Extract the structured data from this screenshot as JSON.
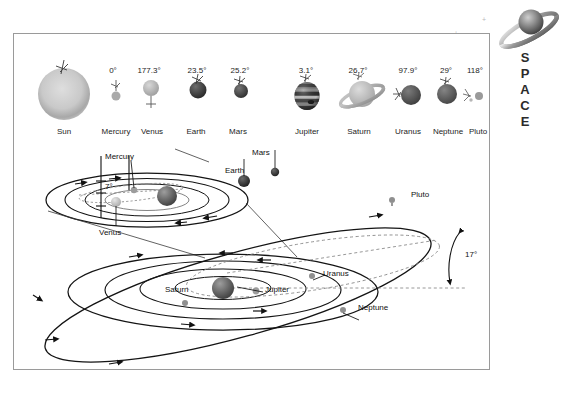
{
  "logo": {
    "wordmark": "SPACE",
    "planet_icon": "saturn-icon"
  },
  "top_row": {
    "caption_note": "Axial tilt of each body in degrees",
    "bodies": [
      {
        "name": "Sun",
        "tilt": "",
        "icon": "sun-icon",
        "color": "#b8b8b8"
      },
      {
        "name": "Mercury",
        "tilt": "0°",
        "icon": "mercury-icon",
        "color": "#a9a9a9"
      },
      {
        "name": "Venus",
        "tilt": "177.3°",
        "icon": "venus-icon",
        "color": "#b0b0b0"
      },
      {
        "name": "Earth",
        "tilt": "23.5°",
        "icon": "earth-icon",
        "color": "#3f3f3f"
      },
      {
        "name": "Mars",
        "tilt": "25.2°",
        "icon": "mars-icon",
        "color": "#4a4a4a"
      },
      {
        "name": "Jupiter",
        "tilt": "3.1°",
        "icon": "jupiter-icon",
        "color": "#6b6b6b"
      },
      {
        "name": "Saturn",
        "tilt": "26.7°",
        "icon": "saturn-icon",
        "color": "#b4b4b4"
      },
      {
        "name": "Uranus",
        "tilt": "97.9°",
        "icon": "uranus-icon",
        "color": "#555555"
      },
      {
        "name": "Neptune",
        "tilt": "29°",
        "icon": "neptune-icon",
        "color": "#5e5e5e"
      },
      {
        "name": "Pluto",
        "tilt": "118°",
        "icon": "pluto-icon",
        "color": "#8d8d8d"
      }
    ]
  },
  "inner_system": {
    "title_hidden": "Inner solar system orbits",
    "angle_annotation": "7°",
    "labels": [
      {
        "body": "Mercury"
      },
      {
        "body": "Venus"
      },
      {
        "body": "Earth"
      },
      {
        "body": "Mars"
      }
    ]
  },
  "outer_system": {
    "title_hidden": "Outer solar system orbits",
    "angle_annotation": "17°",
    "labels": [
      {
        "body": "Jupiter"
      },
      {
        "body": "Saturn"
      },
      {
        "body": "Uranus"
      },
      {
        "body": "Neptune"
      },
      {
        "body": "Pluto"
      }
    ]
  },
  "colors": {
    "frame_border": "#9a9a9a",
    "orbit_line": "#1a1a1a",
    "reference_dash": "#8a8a8a",
    "text": "#1a1a1a",
    "background": "#ffffff"
  }
}
